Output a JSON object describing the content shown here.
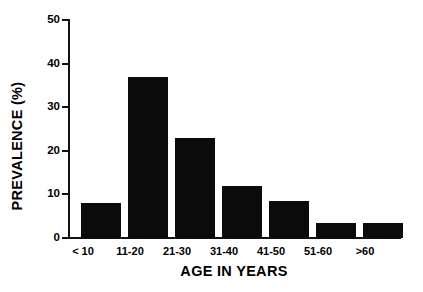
{
  "chart_data": {
    "type": "bar",
    "title": "",
    "subtitle": "",
    "xlabel": "AGE IN YEARS",
    "ylabel": "PREVALENCE (%)",
    "categories": [
      "< 10",
      "11-20",
      "21-30",
      "31-40",
      "41-50",
      "51-60",
      ">60"
    ],
    "values": [
      8,
      37,
      23,
      12,
      8.5,
      3.5,
      3.5
    ],
    "ylim": [
      0,
      50
    ],
    "yticks": [
      0,
      10,
      20,
      30,
      40,
      50
    ],
    "ytick_labels": [
      "0",
      "10",
      "20",
      "30",
      "40",
      "50"
    ],
    "grid": false,
    "legend": null,
    "series": [
      {
        "name": "Prevalence",
        "color": "#0b0b0b",
        "values": [
          8,
          37,
          23,
          12,
          8.5,
          3.5,
          3.5
        ]
      }
    ],
    "bar_color": "#0b0b0b",
    "background_color": "#ffffff",
    "axis_color": "#111111"
  },
  "axes": {
    "y_title": "PREVALENCE (%)",
    "x_title": "AGE IN YEARS"
  }
}
